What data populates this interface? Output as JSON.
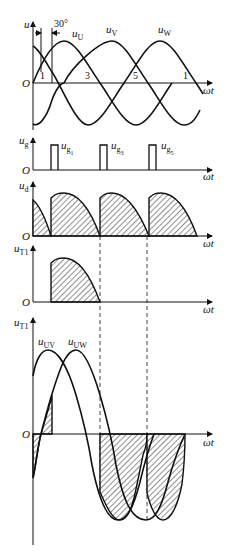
{
  "figure": {
    "panel1": {
      "y_label": "u",
      "origin": "O",
      "x_label": "ωt",
      "angle_annotation": "30°",
      "curves": [
        {
          "name": "u",
          "sub": "U"
        },
        {
          "name": "u",
          "sub": "V"
        },
        {
          "name": "u",
          "sub": "W"
        }
      ],
      "commutation_points": [
        "1",
        "3",
        "5",
        "1"
      ]
    },
    "panel2": {
      "y_label": "u",
      "y_sub": "g",
      "origin": "O",
      "x_label": "ωt",
      "pulses": [
        {
          "name": "u",
          "sub": "g",
          "subsub": "1"
        },
        {
          "name": "u",
          "sub": "g",
          "subsub": "3"
        },
        {
          "name": "u",
          "sub": "g",
          "subsub": "5"
        }
      ]
    },
    "panel3": {
      "y_label": "u",
      "y_sub": "d",
      "origin": "O",
      "x_label": "ωt"
    },
    "panel4": {
      "y_label": "u",
      "y_sub": "T1",
      "origin": "O",
      "x_label": "ωt"
    },
    "panel5": {
      "y_label": "u",
      "y_sub": "T1",
      "origin": "O",
      "x_label": "ωt",
      "curves": [
        {
          "name": "u",
          "sub": "UV"
        },
        {
          "name": "u",
          "sub": "UW"
        }
      ]
    }
  }
}
